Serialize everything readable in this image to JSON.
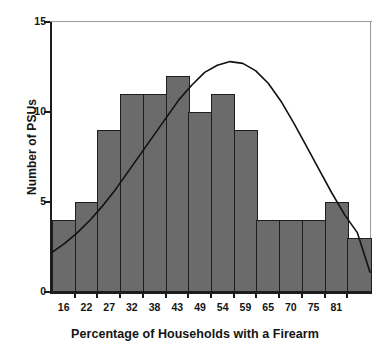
{
  "chart_data": {
    "type": "bar",
    "title": "",
    "subtitle": "",
    "xlabel": "Percentage of Households with a Firearm",
    "ylabel": "Number of PSUs",
    "categories": [
      "13",
      "16",
      "22",
      "27",
      "32",
      "38",
      "43",
      "49",
      "54",
      "59",
      "65",
      "70",
      "75",
      "81"
    ],
    "values": [
      4,
      5,
      9,
      11,
      11,
      12,
      10,
      11,
      9,
      4,
      4,
      4,
      5,
      3
    ],
    "xtick_labels": [
      "16",
      "22",
      "27",
      "32",
      "38",
      "43",
      "49",
      "54",
      "59",
      "65",
      "70",
      "75",
      "81"
    ],
    "ytick_labels": [
      "0",
      "5",
      "10",
      "15"
    ],
    "ytick_values": [
      0,
      5,
      10,
      15
    ],
    "ylim": [
      0,
      15
    ],
    "xlim": [
      13,
      81
    ],
    "grid": false,
    "legend": false,
    "bar_fill_color": "#6b6b6b",
    "bar_edge_color": "#1e1e1e",
    "axis_color": "#1c1c1c",
    "curve_color": "#111111",
    "overlay": {
      "name": "normal-curve",
      "type": "line",
      "mean": 41.5,
      "std": 15.2,
      "peak_value": 12.8,
      "left_end_value": 2.2,
      "right_end_value": 1.1,
      "points": [
        [
          0.0,
          2.2
        ],
        [
          0.04,
          2.7
        ],
        [
          0.08,
          3.3
        ],
        [
          0.12,
          4.0
        ],
        [
          0.16,
          4.8
        ],
        [
          0.2,
          5.7
        ],
        [
          0.24,
          6.7
        ],
        [
          0.28,
          7.7
        ],
        [
          0.32,
          8.7
        ],
        [
          0.36,
          9.7
        ],
        [
          0.4,
          10.7
        ],
        [
          0.44,
          11.5
        ],
        [
          0.48,
          12.2
        ],
        [
          0.52,
          12.6
        ],
        [
          0.56,
          12.8
        ],
        [
          0.6,
          12.7
        ],
        [
          0.64,
          12.3
        ],
        [
          0.68,
          11.6
        ],
        [
          0.72,
          10.6
        ],
        [
          0.76,
          9.4
        ],
        [
          0.8,
          8.1
        ],
        [
          0.84,
          6.8
        ],
        [
          0.88,
          5.5
        ],
        [
          0.92,
          4.3
        ],
        [
          0.96,
          3.3
        ],
        [
          1.0,
          1.1
        ]
      ]
    }
  },
  "axes": {
    "x_title": "Percentage of Households with a Firearm",
    "y_title": "Number of PSUs"
  }
}
